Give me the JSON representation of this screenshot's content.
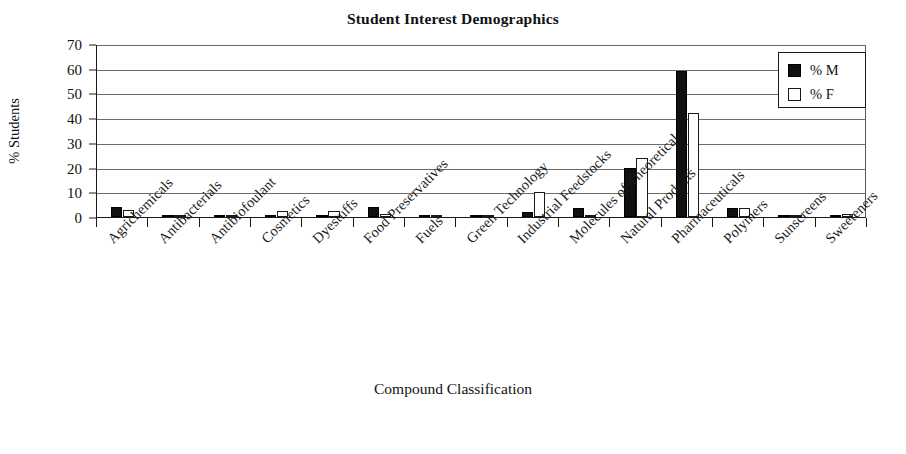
{
  "chart_data": {
    "type": "bar",
    "title": "Student Interest Demographics",
    "xlabel": "Compound Classification",
    "ylabel": "% Students",
    "ylim": [
      0,
      70
    ],
    "ytick_step": 10,
    "yticks": [
      "0",
      "10",
      "20",
      "30",
      "40",
      "50",
      "60",
      "70"
    ],
    "grid": true,
    "grid_axis": "y",
    "legend_position": "top-right",
    "categories": [
      "Agrichemicals",
      "Antibacterials",
      "Antibiofoulant",
      "Cosmetics",
      "Dyestuffs",
      "Food Preservatives",
      "Fuels",
      "Green Technology",
      "Industrial Feedstocks",
      "Molecules of Theoretical...",
      "Natural Products",
      "Pharmaceuticals",
      "Polymers",
      "Sunscreens",
      "Sweeteners"
    ],
    "series": [
      {
        "name": "% M",
        "color": "#101010",
        "values": [
          4.2,
          0.8,
          0.8,
          1.0,
          1.0,
          4.0,
          0.5,
          0.4,
          2.0,
          3.8,
          19.8,
          59.0,
          3.6,
          0.2,
          0.3
        ]
      },
      {
        "name": "% F",
        "color": "#ffffff",
        "values": [
          2.9,
          0.7,
          0.9,
          2.4,
          2.4,
          1.4,
          0.3,
          1.0,
          10.0,
          0.3,
          24.0,
          42.0,
          3.6,
          1.0,
          1.4
        ]
      }
    ]
  },
  "legend": {
    "items": [
      {
        "label": "% M",
        "style": "filled"
      },
      {
        "label": "% F",
        "style": "outlined"
      }
    ]
  }
}
